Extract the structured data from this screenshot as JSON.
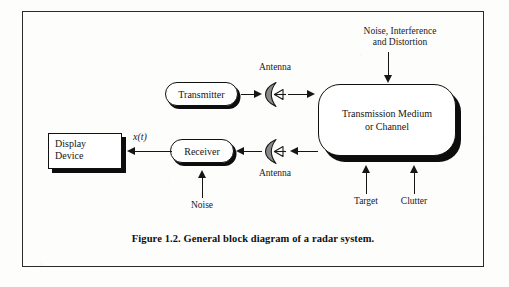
{
  "figure": {
    "caption": "Figure 1.2. General block diagram of a radar system.",
    "border_color": "#2a2a2a",
    "ink_color": "#141414",
    "dish_fill": "#8a8a8a"
  },
  "blocks": {
    "transmitter": {
      "label": "Transmitter",
      "shape": "stadium"
    },
    "receiver": {
      "label": "Receiver",
      "shape": "stadium"
    },
    "medium": {
      "label_line1": "Transmission Medium",
      "label_line2": "or Channel",
      "shape": "rounded-rect"
    },
    "display": {
      "label_line1": "Display",
      "label_line2": "Device",
      "shape": "rect"
    }
  },
  "labels": {
    "antenna_tx": "Antenna",
    "antenna_rx": "Antenna",
    "noise_interference_line1": "Noise, Interference",
    "noise_interference_line2": "and Distortion",
    "target": "Target",
    "clutter": "Clutter",
    "noise_rx": "Noise",
    "signal_xt": "x(t)"
  },
  "icons": {
    "antenna_tx": "parabolic-antenna-icon",
    "antenna_rx": "parabolic-antenna-icon"
  },
  "flows": [
    {
      "from": "transmitter",
      "to": "antenna_tx"
    },
    {
      "from": "antenna_tx",
      "to": "medium"
    },
    {
      "from": "noise-interference-distortion",
      "to": "medium"
    },
    {
      "from": "target",
      "to": "medium"
    },
    {
      "from": "clutter",
      "to": "medium"
    },
    {
      "from": "medium",
      "to": "antenna_rx"
    },
    {
      "from": "antenna_rx",
      "to": "receiver"
    },
    {
      "from": "noise",
      "to": "receiver"
    },
    {
      "from": "receiver",
      "to": "display"
    }
  ]
}
